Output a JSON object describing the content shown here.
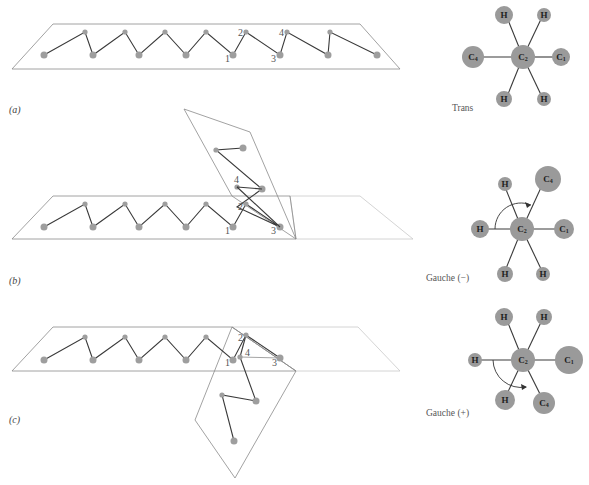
{
  "figure": {
    "panels": [
      {
        "id": "a",
        "label": "(a)",
        "conformation": "Trans",
        "backbone_numbers": [
          "1",
          "2",
          "3",
          "4"
        ],
        "newman": {
          "center": "C2",
          "front_atoms": [
            "C1",
            "H",
            "H"
          ],
          "back_atoms": [
            "C4",
            "H",
            "H"
          ],
          "arrow": false
        }
      },
      {
        "id": "b",
        "label": "(b)",
        "conformation": "Gauche (−)",
        "backbone_numbers": [
          "1",
          "2",
          "3",
          "4"
        ],
        "newman": {
          "center": "C2",
          "front_atoms": [
            "C1",
            "H",
            "H"
          ],
          "back_atoms": [
            "C4",
            "H",
            "H"
          ],
          "arrow": true,
          "arrow_direction": "clockwise"
        }
      },
      {
        "id": "c",
        "label": "(c)",
        "conformation": "Gauche (+)",
        "backbone_numbers": [
          "1",
          "2",
          "3",
          "4"
        ],
        "newman": {
          "center": "C2",
          "front_atoms": [
            "C1",
            "H",
            "H"
          ],
          "back_atoms": [
            "C4",
            "H",
            "H"
          ],
          "arrow": true,
          "arrow_direction": "counterclockwise"
        }
      }
    ],
    "atom_labels": {
      "H": "H",
      "C": "C",
      "C1_sub": "1",
      "C2_sub": "2",
      "C4_sub": "4"
    }
  }
}
